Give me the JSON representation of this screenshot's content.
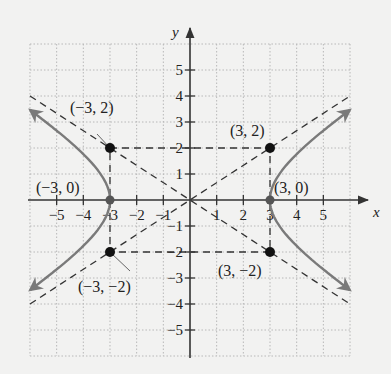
{
  "chart_data": {
    "type": "line",
    "title": "",
    "xlabel": "x",
    "ylabel": "y",
    "xlim": [
      -6,
      6
    ],
    "ylim": [
      -6,
      6
    ],
    "grid": true,
    "x_ticks": [
      -5,
      -4,
      -3,
      -2,
      -1,
      1,
      2,
      3,
      4,
      5
    ],
    "x_tick_labels": [
      "−5",
      "−4",
      "−3",
      "−2",
      "−1",
      "1",
      "2",
      "3",
      "4",
      "5"
    ],
    "y_ticks": [
      5,
      4,
      3,
      2,
      1,
      -1,
      -2,
      -3,
      -4,
      -5
    ],
    "y_tick_labels": [
      "5",
      "4",
      "3",
      "2",
      "1",
      "−1",
      "−2",
      "−3",
      "−4",
      "−5"
    ],
    "series": [
      {
        "name": "hyperbola-right-branch",
        "equation": "x = 3*sqrt(1 + y^2/4)",
        "style": "solid-gray-arrows",
        "y_range": [
          -3.4,
          3.4
        ]
      },
      {
        "name": "hyperbola-left-branch",
        "equation": "x = -3*sqrt(1 + y^2/4)",
        "style": "solid-gray-arrows",
        "y_range": [
          -3.4,
          3.4
        ]
      },
      {
        "name": "asymptote-positive",
        "equation": "y = (2/3)x",
        "style": "dashed",
        "x_range": [
          -6,
          6
        ]
      },
      {
        "name": "asymptote-negative",
        "equation": "y = -(2/3)x",
        "style": "dashed",
        "x_range": [
          -6,
          6
        ]
      }
    ],
    "rectangle": {
      "corners": [
        [
          -3,
          2
        ],
        [
          3,
          2
        ],
        [
          3,
          -2
        ],
        [
          -3,
          -2
        ]
      ],
      "style": "dashed"
    },
    "points": [
      {
        "x": -3,
        "y": 2,
        "label": "(−3, 2)",
        "filled": true
      },
      {
        "x": 3,
        "y": 2,
        "label": "(3, 2)",
        "filled": true
      },
      {
        "x": -3,
        "y": -2,
        "label": "(−3, −2)",
        "filled": true
      },
      {
        "x": 3,
        "y": -2,
        "label": "(3, −2)",
        "filled": true
      },
      {
        "x": -3,
        "y": 0,
        "label": "(−3, 0)",
        "filled": true,
        "vertex": true
      },
      {
        "x": 3,
        "y": 0,
        "label": "(3, 0)",
        "filled": true,
        "vertex": true
      }
    ]
  },
  "colors": {
    "background": "#f2f2f1",
    "grid": "#b8b8b8",
    "axis": "#333333",
    "curve": "#7a7a7a",
    "dashed": "#333333",
    "point": "#111111"
  }
}
